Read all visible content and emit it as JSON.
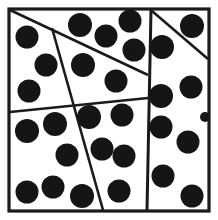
{
  "figure": {
    "type": "spatial-partition-dot-pattern",
    "width": 218,
    "height": 220,
    "background_color": "#ffffff",
    "line_color": "#1a1a1a",
    "dot_color": "#151515",
    "frame": {
      "x": 9,
      "y": 9,
      "width": 200,
      "height": 202,
      "stroke_width": 3.2
    },
    "partition_lines": [
      {
        "name": "upper-left-diagonal",
        "x1": 10,
        "y1": 10,
        "x2": 148,
        "y2": 75,
        "stroke_width": 2.6
      },
      {
        "name": "center-near-vertical",
        "x1": 52,
        "y1": 28,
        "x2": 103,
        "y2": 210,
        "stroke_width": 2.6
      },
      {
        "name": "mid-horizontal",
        "x1": 10,
        "y1": 112,
        "x2": 148,
        "y2": 98,
        "stroke_width": 2.6
      },
      {
        "name": "right-panel-separator",
        "x1": 151,
        "y1": 10,
        "x2": 147,
        "y2": 210,
        "stroke_width": 3.0
      },
      {
        "name": "right-panel-diagonal",
        "x1": 152,
        "y1": 11,
        "x2": 208,
        "y2": 59,
        "stroke_width": 2.6
      }
    ],
    "dot_radius": 11.5,
    "dot_count": 29,
    "dots": [
      {
        "region": "upper-left",
        "cx": 27,
        "cy": 37,
        "r": 11.5
      },
      {
        "region": "upper-left",
        "cx": 46,
        "cy": 65,
        "r": 11.5
      },
      {
        "region": "upper-left",
        "cx": 29,
        "cy": 91,
        "r": 11.5
      },
      {
        "region": "upper-strip",
        "cx": 80,
        "cy": 25,
        "r": 12.0
      },
      {
        "region": "upper-strip",
        "cx": 106,
        "cy": 36,
        "r": 11.5
      },
      {
        "region": "upper-strip",
        "cx": 130,
        "cy": 21,
        "r": 11.5
      },
      {
        "region": "upper-strip",
        "cx": 134,
        "cy": 50,
        "r": 11.5
      },
      {
        "region": "upper-middle",
        "cx": 83,
        "cy": 65,
        "r": 12.0
      },
      {
        "region": "upper-middle",
        "cx": 116,
        "cy": 81,
        "r": 11.5
      },
      {
        "region": "lower-left",
        "cx": 27,
        "cy": 131,
        "r": 12.0
      },
      {
        "region": "lower-left",
        "cx": 55,
        "cy": 124,
        "r": 12.0
      },
      {
        "region": "lower-left",
        "cx": 67,
        "cy": 155,
        "r": 11.5
      },
      {
        "region": "lower-left",
        "cx": 27,
        "cy": 192,
        "r": 11.5
      },
      {
        "region": "lower-left",
        "cx": 53,
        "cy": 187,
        "r": 11.5
      },
      {
        "region": "lower-left",
        "cx": 82,
        "cy": 196,
        "r": 12.0
      },
      {
        "region": "lower-middle",
        "cx": 89,
        "cy": 117,
        "r": 12.0
      },
      {
        "region": "lower-middle",
        "cx": 122,
        "cy": 115,
        "r": 11.5
      },
      {
        "region": "lower-middle",
        "cx": 102,
        "cy": 149,
        "r": 11.5
      },
      {
        "region": "lower-middle",
        "cx": 124,
        "cy": 156,
        "r": 11.5
      },
      {
        "region": "lower-middle",
        "cx": 119,
        "cy": 191,
        "r": 11.5
      },
      {
        "region": "right-upper-triangle",
        "cx": 192,
        "cy": 26,
        "r": 12.0
      },
      {
        "region": "right-panel",
        "cx": 162,
        "cy": 47,
        "r": 12.0
      },
      {
        "region": "right-panel",
        "cx": 161,
        "cy": 96,
        "r": 12.0
      },
      {
        "region": "right-panel",
        "cx": 191,
        "cy": 87,
        "r": 11.5
      },
      {
        "region": "right-panel",
        "cx": 161,
        "cy": 127,
        "r": 11.5
      },
      {
        "region": "right-panel",
        "cx": 188,
        "cy": 142,
        "r": 11.5
      },
      {
        "region": "right-panel",
        "cx": 163,
        "cy": 176,
        "r": 11.5
      },
      {
        "region": "right-panel",
        "cx": 192,
        "cy": 196,
        "r": 11.5
      },
      {
        "region": "right-panel",
        "cx": 205,
        "cy": 117,
        "r": 5.0
      }
    ]
  }
}
